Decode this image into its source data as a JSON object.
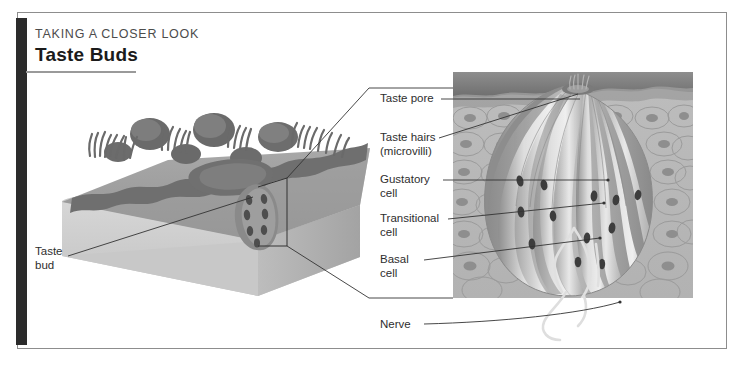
{
  "figure": {
    "kicker": "TAKING A CLOSER LOOK",
    "title": "Taste Buds",
    "domain": "anatomy-diagram"
  },
  "labels": {
    "taste_bud": "Taste\nbud",
    "taste_pore": "Taste pore",
    "taste_hairs": "Taste hairs\n(microvilli)",
    "gustatory_cell": "Gustatory\ncell",
    "transitional_cell": "Transitional\ncell",
    "basal_cell": "Basal\ncell",
    "nerve": "Nerve"
  },
  "panels": {
    "overview": {
      "name": "tongue-surface-block",
      "caption_label": "Taste\nbud",
      "description": "3D cutaway block of tongue epithelium with papillae and filiform hairs"
    },
    "detail": {
      "name": "taste-bud-cross-section",
      "description": "Magnified cross-section of a single taste bud embedded in stratified epithelium",
      "callout_labels": [
        "Taste pore",
        "Taste hairs\n(microvilli)",
        "Gustatory\ncell",
        "Transitional\ncell",
        "Basal\ncell",
        "Nerve"
      ]
    }
  },
  "colors": {
    "frame_border": "#8d8d8d",
    "spine": "#2b2b2b",
    "rule": "#9a9a9a",
    "kicker_text": "#4c4c4c",
    "title_text": "#1b1b1b",
    "label_text": "#2e2e2e",
    "leader_line": "#333333",
    "block_top": "#9b9b9b",
    "block_front": "#c9c9c9",
    "block_side": "#b0b0b0",
    "papilla_dark": "#6e6e6e",
    "epithelium_bg": "#b6b6b6",
    "bud_light": "#e2e2e2",
    "bud_mid": "#c0c0c0",
    "bud_dark": "#8e8e8e",
    "nerve_fiber": "#dcdcdc"
  }
}
